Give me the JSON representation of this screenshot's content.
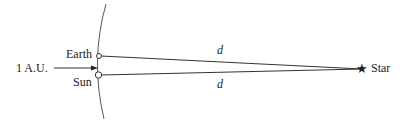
{
  "diagram": {
    "type": "parallax geometry",
    "labels": {
      "earth": "Earth",
      "sun": "Sun",
      "star": "Star",
      "baseline": "1 A.U.",
      "distance_top": "d",
      "distance_bottom": "d"
    },
    "colors": {
      "stroke": "#333333",
      "text": "#222222",
      "background": "#ffffff"
    },
    "star_symbol": "★"
  }
}
